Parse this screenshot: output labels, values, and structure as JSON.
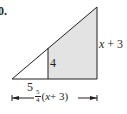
{
  "problem_number": "0.",
  "diagram": {
    "labels": {
      "inner_height": "4",
      "inner_base": "5",
      "outer_height_var": "x",
      "outer_height_rest": " + 3",
      "outer_base_frac_num": "5",
      "outer_base_frac_den": "4",
      "outer_base_expr_open": "(",
      "outer_base_var": "x",
      "outer_base_expr_rest": " + 3)"
    },
    "colors": {
      "line": "#231f20",
      "shade": "#e3e3e3"
    }
  }
}
